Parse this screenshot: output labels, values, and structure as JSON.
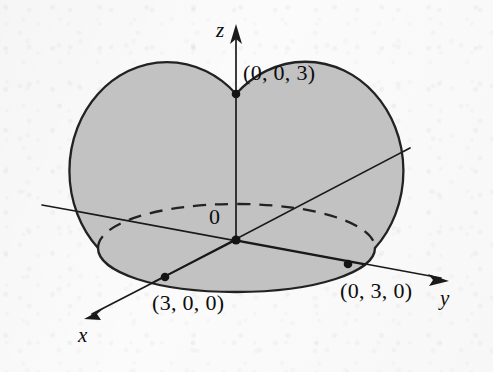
{
  "figure": {
    "kind": "3d-hemisphere-diagram",
    "background_color": "#fbfbfb",
    "solid_fill_color": "#c2c2c2",
    "outline_color": "#222222",
    "axis_color": "#1a1a1a"
  },
  "axes": [
    {
      "id": "z",
      "label": "z",
      "direction": "up",
      "has_arrowhead": true,
      "arrow_tip": [
        236,
        25
      ]
    },
    {
      "id": "y",
      "label": "y",
      "direction": "lower-right",
      "has_arrowhead": true,
      "arrow_tip": [
        448,
        280
      ]
    },
    {
      "id": "x",
      "label": "x",
      "direction": "lower-left",
      "has_arrowhead": true,
      "arrow_tip": [
        85,
        318
      ]
    }
  ],
  "origin": {
    "label": "0",
    "point": [
      236,
      240
    ]
  },
  "points": [
    {
      "id": "z-intercept",
      "label": "(0, 0, 3)",
      "coords": [
        0,
        0,
        3
      ],
      "dot": [
        236,
        94
      ]
    },
    {
      "id": "x-intercept",
      "label": "(3, 0, 0)",
      "coords": [
        3,
        0,
        0
      ],
      "dot": [
        165,
        277
      ]
    },
    {
      "id": "y-intercept",
      "label": "(0, 3, 0)",
      "coords": [
        0,
        3,
        0
      ],
      "dot": [
        348,
        264
      ]
    }
  ],
  "surface": {
    "radius": 3,
    "equator_back_style": "dashed",
    "equator_front_style": "solid",
    "dome_style": "solid"
  }
}
